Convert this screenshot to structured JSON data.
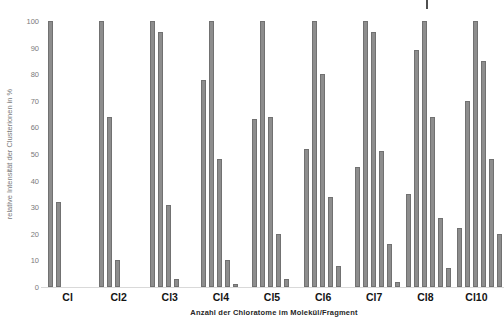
{
  "chart_data": {
    "type": "bar",
    "title": "",
    "xlabel": "Anzahl der Chloratome im Molekül/Fragment",
    "ylabel": "relative Intensität der Clusterionen in %",
    "ylim": [
      0,
      100
    ],
    "ytick_step": 10,
    "ytick_labels": [
      "0",
      "10",
      "20",
      "30",
      "40",
      "50",
      "60",
      "70",
      "80",
      "90",
      "100"
    ],
    "grid": false,
    "legend": "none",
    "groups": [
      {
        "category": "Cl",
        "values": [
          100,
          32
        ]
      },
      {
        "category": "Cl2",
        "values": [
          100,
          64,
          10
        ]
      },
      {
        "category": "Cl3",
        "values": [
          100,
          96,
          31,
          3
        ]
      },
      {
        "category": "Cl4",
        "values": [
          78,
          100,
          48,
          10,
          1
        ]
      },
      {
        "category": "Cl5",
        "values": [
          63,
          100,
          64,
          20,
          3
        ]
      },
      {
        "category": "Cl6",
        "values": [
          52,
          100,
          80,
          34,
          8
        ]
      },
      {
        "category": "Cl7",
        "values": [
          45,
          100,
          96,
          51,
          16,
          2
        ]
      },
      {
        "category": "Cl8",
        "values": [
          35,
          89,
          100,
          64,
          26,
          7
        ]
      },
      {
        "category": "Cl10",
        "values": [
          22,
          70,
          100,
          85,
          48,
          20
        ]
      }
    ],
    "colors": {
      "bar": "#8d8d8d",
      "bar_edge": "#717171",
      "axis_line": "#d9d9d9",
      "tick_label": "#7a7a7a",
      "category_label": "#141414"
    }
  },
  "annotations": {
    "stray_mark": "short dark vertical mark at top edge above the Cl8 group"
  }
}
